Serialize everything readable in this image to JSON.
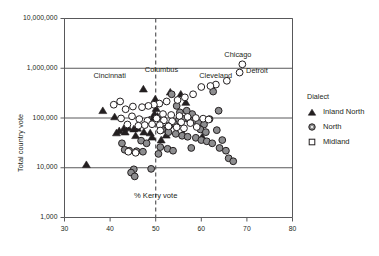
{
  "chart_data": {
    "type": "scatter",
    "title": "",
    "xlabel": "",
    "ylabel": "Total country vote",
    "xlim": [
      30,
      80
    ],
    "ylim": [
      1000,
      10000000
    ],
    "yscale": "log",
    "grid": true,
    "xticks": [
      30,
      40,
      50,
      60,
      70,
      80
    ],
    "xtick_labels": [
      "30",
      "40",
      "50",
      "60",
      "70",
      "80"
    ],
    "yticks": [
      1000,
      10000,
      100000,
      1000000,
      10000000
    ],
    "ytick_labels": [
      "1,000",
      "10,000",
      "100,000",
      "1,000,000",
      "10,000,000"
    ],
    "legend": {
      "title": "Dialect",
      "position": "right",
      "entries": [
        {
          "name": "Inland North",
          "marker": "triangle",
          "fill": "#231f20",
          "edge": "#231f20"
        },
        {
          "name": "North",
          "marker": "circle",
          "fill": "#8c8c8c",
          "edge": "#231f20"
        },
        {
          "name": "Midland",
          "marker": "square",
          "fill": "#ffffff",
          "edge": "#231f20"
        }
      ]
    },
    "reference_lines": [
      {
        "orientation": "vertical",
        "value": 50,
        "style": "dashed",
        "label": "% Kerry vote"
      }
    ],
    "annotations": [
      {
        "text": "Chicago",
        "x": 69.0,
        "y": 1300000
      },
      {
        "text": "Detroit",
        "x": 68.5,
        "y": 900000
      },
      {
        "text": "Cleveland",
        "x": 63.5,
        "y": 500000
      },
      {
        "text": "Cincinnati",
        "x": 46.0,
        "y": 620000
      },
      {
        "text": "Columbus",
        "x": 52.0,
        "y": 680000
      }
    ],
    "series": [
      {
        "name": "Inland North",
        "marker": "triangle",
        "points": [
          [
            47.3,
            380000
          ],
          [
            53.2,
            330000
          ],
          [
            49.9,
            240000
          ],
          [
            50.3,
            195000
          ],
          [
            50.1,
            155000
          ],
          [
            49.7,
            120000
          ],
          [
            50.4,
            108000
          ],
          [
            49.4,
            99000
          ],
          [
            48.6,
            92000
          ],
          [
            43.0,
            61000
          ],
          [
            44.0,
            63000
          ],
          [
            45.2,
            60000
          ],
          [
            46.0,
            62000
          ],
          [
            42.0,
            55000
          ],
          [
            43.3,
            52000
          ],
          [
            47.4,
            52000
          ],
          [
            48.8,
            50000
          ],
          [
            41.4,
            50000
          ],
          [
            38.4,
            140000
          ],
          [
            41.0,
            105000
          ],
          [
            55.5,
            300000
          ],
          [
            56.6,
            205000
          ],
          [
            57.2,
            110000
          ],
          [
            60.2,
            42000
          ],
          [
            56.0,
            48000
          ],
          [
            34.8,
            11500
          ],
          [
            49.2,
            41000
          ],
          [
            52.3,
            45000
          ],
          [
            51.2,
            36000
          ],
          [
            45.6,
            44000
          ]
        ]
      },
      {
        "name": "North",
        "marker": "circle",
        "points": [
          [
            53.5,
            300000
          ],
          [
            54.6,
            175000
          ],
          [
            55.3,
            130000
          ],
          [
            56.0,
            96000
          ],
          [
            57.4,
            92000
          ],
          [
            58.6,
            88000
          ],
          [
            59.4,
            80000
          ],
          [
            60.6,
            74000
          ],
          [
            61.8,
            95000
          ],
          [
            62.6,
            340000
          ],
          [
            63.8,
            140000
          ],
          [
            58.0,
            120000
          ],
          [
            56.8,
            140000
          ],
          [
            55.0,
            88000
          ],
          [
            54.0,
            78000
          ],
          [
            53.0,
            70000
          ],
          [
            52.2,
            62000
          ],
          [
            51.4,
            58000
          ],
          [
            52.8,
            52000
          ],
          [
            54.4,
            48000
          ],
          [
            55.8,
            44000
          ],
          [
            57.0,
            42000
          ],
          [
            58.8,
            40000
          ],
          [
            60.0,
            36000
          ],
          [
            61.2,
            34000
          ],
          [
            62.4,
            31000
          ],
          [
            63.4,
            57000
          ],
          [
            64.6,
            36000
          ],
          [
            66.0,
            15500
          ],
          [
            67.0,
            13500
          ],
          [
            51.0,
            26000
          ],
          [
            52.6,
            24000
          ],
          [
            53.8,
            22000
          ],
          [
            50.6,
            19000
          ],
          [
            45.2,
            9300
          ],
          [
            44.6,
            8000
          ],
          [
            45.4,
            6700
          ],
          [
            43.2,
            23000
          ],
          [
            44.2,
            22000
          ],
          [
            45.8,
            21500
          ],
          [
            47.2,
            21000
          ],
          [
            42.6,
            31000
          ],
          [
            46.8,
            35000
          ],
          [
            48.0,
            31000
          ],
          [
            59.8,
            59000
          ],
          [
            61.0,
            52000
          ],
          [
            64.0,
            25000
          ],
          [
            65.4,
            22000
          ],
          [
            49.0,
            9500
          ],
          [
            57.8,
            25000
          ]
        ]
      },
      {
        "name": "Midland",
        "marker": "circle_open",
        "points": [
          [
            69.0,
            1200000
          ],
          [
            68.4,
            820000
          ],
          [
            65.6,
            560000
          ],
          [
            63.2,
            470000
          ],
          [
            62.0,
            440000
          ],
          [
            60.0,
            420000
          ],
          [
            58.2,
            300000
          ],
          [
            56.4,
            260000
          ],
          [
            54.8,
            230000
          ],
          [
            52.4,
            215000
          ],
          [
            50.8,
            195000
          ],
          [
            49.6,
            185000
          ],
          [
            48.4,
            175000
          ],
          [
            47.0,
            165000
          ],
          [
            45.0,
            170000
          ],
          [
            43.4,
            150000
          ],
          [
            42.2,
            215000
          ],
          [
            40.8,
            185000
          ],
          [
            51.6,
            120000
          ],
          [
            53.4,
            115000
          ],
          [
            55.2,
            110000
          ],
          [
            57.0,
            105000
          ],
          [
            58.8,
            100000
          ],
          [
            60.4,
            97000
          ],
          [
            61.6,
            93000
          ],
          [
            50.2,
            98000
          ],
          [
            51.8,
            90000
          ],
          [
            53.6,
            86000
          ],
          [
            55.6,
            82000
          ],
          [
            57.6,
            79000
          ],
          [
            48.2,
            88000
          ],
          [
            46.4,
            95000
          ],
          [
            44.8,
            108000
          ],
          [
            49.2,
            75000
          ],
          [
            50.9,
            72000
          ],
          [
            52.8,
            68000
          ],
          [
            54.6,
            65000
          ],
          [
            56.2,
            62000
          ],
          [
            44.0,
            21000
          ],
          [
            45.6,
            20000
          ],
          [
            59.0,
            66000
          ],
          [
            47.6,
            72000
          ],
          [
            46.2,
            70000
          ],
          [
            51.0,
            56000
          ],
          [
            43.8,
            74000
          ],
          [
            42.4,
            98000
          ]
        ]
      }
    ]
  },
  "axis": {
    "y_title": "Total country vote"
  }
}
